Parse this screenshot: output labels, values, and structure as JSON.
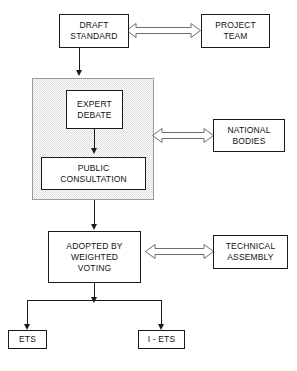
{
  "diagram": {
    "nodes": {
      "draft_standard": {
        "line1": "DRAFT",
        "line2": "STANDARD"
      },
      "project_team": {
        "line1": "PROJECT",
        "line2": "TEAM"
      },
      "expert_debate": {
        "line1": "EXPERT",
        "line2": "DEBATE"
      },
      "public_consultation": {
        "line1": "PUBLIC",
        "line2": "CONSULTATION"
      },
      "national_bodies": {
        "line1": "NATIONAL",
        "line2": "BODIES"
      },
      "adopted_by_weighted_voting": {
        "line1": "ADOPTED BY",
        "line2": "WEIGHTED",
        "line3": "VOTING"
      },
      "technical_assembly": {
        "line1": "TECHNICAL",
        "line2": "ASSEMBLY"
      },
      "ets": {
        "line1": "ETS"
      },
      "i_ets": {
        "line1": "I - ETS"
      }
    },
    "connectors": [
      {
        "name": "draft-standard-to-project-team",
        "kind": "bidirectional-open-arrow"
      },
      {
        "name": "draft-standard-to-consultation-panel",
        "kind": "down-arrow"
      },
      {
        "name": "expert-debate-to-public-consultation",
        "kind": "down-arrow"
      },
      {
        "name": "consultation-panel-to-national-bodies",
        "kind": "bidirectional-open-arrow"
      },
      {
        "name": "consultation-panel-to-adopted",
        "kind": "down-arrow"
      },
      {
        "name": "adopted-to-technical-assembly",
        "kind": "bidirectional-open-arrow"
      },
      {
        "name": "adopted-to-outputs",
        "kind": "branching-down-arrows"
      }
    ],
    "colors": {
      "stroke": "#1a1a1a",
      "panel_fill": "#dcdcdc",
      "panel_stroke": "#9a9a9a",
      "arrow_stroke": "#6e6e6e",
      "background": "#ffffff"
    }
  }
}
